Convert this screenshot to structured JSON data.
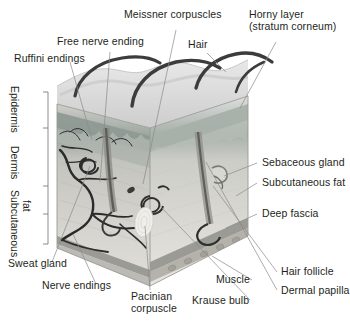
{
  "figure": {
    "type": "anatomical-diagram",
    "style": "grayscale"
  },
  "labels": {
    "meissner": "Meissner corpuscles",
    "horny_layer_line1": "Horny layer",
    "horny_layer_line2": "(stratum corneum)",
    "free_nerve_ending": "Free nerve ending",
    "hair": "Hair",
    "ruffini": "Ruffini endings",
    "sebaceous": "Sebaceous gland",
    "subcutaneous_fat": "Subcutaneous fat",
    "deep_fascia": "Deep fascia",
    "hair_follicle": "Hair follicle",
    "dermal_papilla": "Dermal papilla",
    "muscle": "Muscle",
    "krause_bulb": "Krause bulb",
    "pacinian_line1": "Pacinian",
    "pacinian_line2": "corpuscle",
    "nerve_endings": "Nerve endings",
    "sweat_gland": "Sweat gland"
  },
  "layer_brackets": [
    {
      "name": "Epidermis"
    },
    {
      "name": "Dermis"
    },
    {
      "name": "Subcutaneous"
    },
    {
      "name": "fat"
    }
  ],
  "colors": {
    "text": "#231f20",
    "leader_line": "#8a8a8a",
    "bracket": "#6f6f6f",
    "background": "#ffffff",
    "epidermis_top": "#d9d9d9",
    "epidermis_band": "#8f9a93",
    "dermis": "#c7c7c2",
    "subcutaneous": "#dedcd6",
    "fascia": "#9b9b96",
    "muscle": "#b4b2ab",
    "hair_dark": "#3c3c3c",
    "vessel_dark": "#2b2b2b"
  }
}
